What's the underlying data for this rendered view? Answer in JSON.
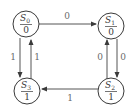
{
  "diagram": {
    "type": "moore-state-machine",
    "colors": {
      "stroke": "#3a3a3a",
      "edge": "#555555",
      "label": "#6a6a6a",
      "background": "#ffffff"
    },
    "states": [
      {
        "id": "S0",
        "name": "S",
        "sub": "0",
        "output": "0"
      },
      {
        "id": "S1",
        "name": "S",
        "sub": "1",
        "output": "0"
      },
      {
        "id": "S2",
        "name": "S",
        "sub": "2",
        "output": "1"
      },
      {
        "id": "S3",
        "name": "S",
        "sub": "3",
        "output": "1"
      }
    ],
    "transitions": [
      {
        "from": "S0",
        "to": "S1",
        "input": "0"
      },
      {
        "from": "S0",
        "to": "S3",
        "input": "1"
      },
      {
        "from": "S3",
        "to": "S0",
        "input": "1"
      },
      {
        "from": "S1",
        "to": "S2",
        "input": "0"
      },
      {
        "from": "S2",
        "to": "S1",
        "input": "0"
      },
      {
        "from": "S2",
        "to": "S3",
        "input": "1"
      }
    ]
  }
}
